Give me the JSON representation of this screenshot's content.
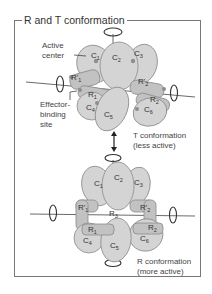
{
  "figure": {
    "title": "R and T conformation",
    "labels": {
      "active_center": [
        "Active",
        "center"
      ],
      "effector_site": [
        "Effector-",
        "binding",
        "site"
      ],
      "t_state": [
        "T conformation",
        "(less active)"
      ],
      "r_state": [
        "R conformation",
        "(more active)"
      ]
    },
    "t_complex": {
      "catalytic": [
        "C",
        "C",
        "C",
        "C",
        "C",
        "C"
      ],
      "catalytic_subs": [
        "1",
        "2",
        "3",
        "4",
        "5",
        "6"
      ],
      "regulatory": [
        "R'1",
        "R1",
        "R'2",
        "R2"
      ]
    },
    "r_complex": {
      "catalytic_subs": [
        "1",
        "2",
        "3",
        "4",
        "5",
        "6"
      ],
      "regulatory": [
        "R'1",
        "R1",
        "R'2",
        "R2",
        "R3"
      ]
    },
    "colors": {
      "subunit_fill": "#d4d4d4",
      "subunit_stroke": "#8a8a8a",
      "regulatory_fill": "#bdbdbd",
      "site_dot": "#8e8e8e",
      "frame": "#777777"
    }
  }
}
